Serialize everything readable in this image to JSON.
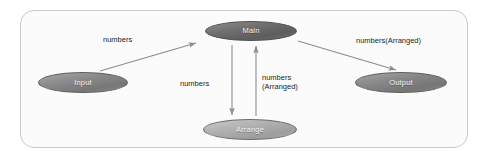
{
  "diagram": {
    "type": "data-flow-diagram",
    "nodes": [
      {
        "id": "main",
        "label": "Main",
        "role": "process"
      },
      {
        "id": "input",
        "label": "Input",
        "role": "source"
      },
      {
        "id": "output",
        "label": "Output",
        "role": "sink"
      },
      {
        "id": "arrange",
        "label": "Arrange",
        "role": "process"
      }
    ],
    "edges": [
      {
        "id": "input-to-main",
        "from": "input",
        "to": "main",
        "label": "numbers",
        "direction": "up-right"
      },
      {
        "id": "main-to-output",
        "from": "main",
        "to": "output",
        "label": "numbers(Arranged)",
        "direction": "down-right"
      },
      {
        "id": "main-to-arrange",
        "from": "main",
        "to": "arrange",
        "label": "numbers",
        "direction": "down"
      },
      {
        "id": "arrange-to-main",
        "from": "arrange",
        "to": "main",
        "label_line1": "numbers",
        "label_line2": "(Arranged)",
        "direction": "up"
      }
    ],
    "colors": {
      "frame_border": "#c9c9c9",
      "frame_fill": "#fbfbfb",
      "node_main": "#6f6f6f",
      "node_input": "#8a8a8a",
      "node_output": "#888888",
      "node_arrange": "#b0b0b0",
      "edge_stroke": "#8d8d8d",
      "label_text": "#1d1d1d",
      "node_text": "#f2f2f2"
    }
  }
}
